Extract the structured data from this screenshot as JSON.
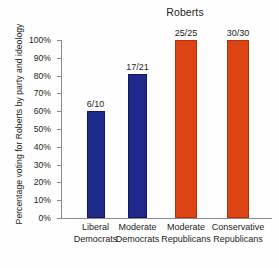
{
  "chart_data": {
    "type": "bar",
    "title": "Roberts",
    "xlabel": "",
    "ylabel": "Percentage voting for Roberts by party and ideology",
    "ylim": [
      0,
      100
    ],
    "grid": false,
    "legend": "none",
    "y_ticks": [
      "0%",
      "10%",
      "20%",
      "30%",
      "40%",
      "50%",
      "60%",
      "70%",
      "80%",
      "90%",
      "100%"
    ],
    "y_tick_values": [
      0,
      10,
      20,
      30,
      40,
      50,
      60,
      70,
      80,
      90,
      100
    ],
    "categories": [
      "Liberal Democrats",
      "Moderate Democrats",
      "Moderate Republicans",
      "Conservative Republicans"
    ],
    "category_lines": [
      [
        "Liberal",
        "Democrats"
      ],
      [
        "Moderate",
        "Democrats"
      ],
      [
        "Moderate",
        "Republicans"
      ],
      [
        "Conservative",
        "Republicans"
      ]
    ],
    "values": [
      60,
      81,
      100,
      100
    ],
    "data_labels": [
      "6/10",
      "17/21",
      "25/25",
      "30/30"
    ],
    "series": [
      {
        "name": "Percentage voting for Roberts",
        "values": [
          60,
          81,
          100,
          100
        ]
      }
    ],
    "bar_colors": [
      "#1f2a8c",
      "#1f2a8c",
      "#dd4414",
      "#dd4414"
    ],
    "colors": {
      "democrat": "#1f2a8c",
      "republican": "#dd4414",
      "axis": "#8a8a8a",
      "text": "#231f20",
      "background": "#fefefe"
    }
  }
}
